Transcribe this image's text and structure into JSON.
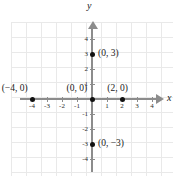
{
  "figure": {
    "type": "coordinate-plane",
    "axis_labels": {
      "x": "x",
      "y": "y"
    }
  },
  "chart_data": {
    "type": "scatter",
    "title": "",
    "xlabel": "x",
    "ylabel": "y",
    "xlim": [
      -5,
      5
    ],
    "ylim": [
      -5,
      5
    ],
    "grid": true,
    "legend": "none",
    "x_ticks": [
      "-4",
      "-3",
      "-2",
      "-1",
      "1",
      "2",
      "3",
      "4"
    ],
    "x_tick_values": [
      -4,
      -3,
      -2,
      -1,
      1,
      2,
      3,
      4
    ],
    "y_ticks": [
      "4",
      "3",
      "2",
      "1",
      "-1",
      "-2",
      "-3",
      "-4"
    ],
    "y_tick_values": [
      4,
      3,
      2,
      1,
      -1,
      -2,
      -3,
      -4
    ],
    "points": [
      {
        "x": -4,
        "y": 0,
        "label": "(−4, 0)",
        "label_position": "above-left"
      },
      {
        "x": 0,
        "y": 0,
        "label": "(0, 0)",
        "label_position": "above-left"
      },
      {
        "x": 2,
        "y": 0,
        "label": "(2, 0)",
        "label_position": "above"
      },
      {
        "x": 0,
        "y": 3,
        "label": "(0, 3)",
        "label_position": "right"
      },
      {
        "x": 0,
        "y": -3,
        "label": "(0, −3)",
        "label_position": "right"
      }
    ]
  },
  "colors": {
    "background": "#ffffff",
    "gridline": "#e9e9e9",
    "axis": "#8c8c8c",
    "point": "#111111",
    "text": "#1a1a1a"
  }
}
